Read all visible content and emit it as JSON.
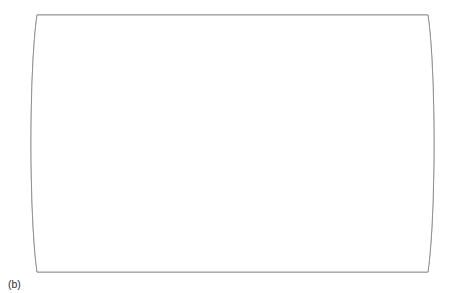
{
  "figure": {
    "caption": "(b)"
  },
  "graticule": {
    "labels": [
      {
        "id": "tropic-cancer",
        "text": "23½°N",
        "y": 112
      },
      {
        "id": "equator",
        "text": "0°",
        "y": 143
      },
      {
        "id": "tropic-capricorn",
        "text": "23½°S",
        "y": 175
      }
    ]
  },
  "legend": {
    "title": "Intermediate environments",
    "items": [
      {
        "label": "Savannah zones",
        "color": "#dcdcdc"
      },
      {
        "label": "Mediterranean zones",
        "color": "#9a9a9a"
      },
      {
        "label": "Mid-latitude grasslands",
        "color": "#6e6e6e"
      }
    ]
  },
  "colors": {
    "savannah": "#dcdcdc",
    "mediterranean": "#9a9a9a",
    "grassland": "#6e6e6e",
    "coastline": "#6e6e6e",
    "frame": "#7a7a7a",
    "text": "#2b2b2b",
    "background": "#ffffff"
  },
  "map": {
    "projection": "pseudo-cylindrical",
    "regions": [
      {
        "name": "North America Great Plains",
        "zone": "Mid-latitude grasslands"
      },
      {
        "name": "Central Mexico",
        "zone": "Savannah zones"
      },
      {
        "name": "California coast",
        "zone": "Mediterranean zones"
      },
      {
        "name": "Llanos and Cerrado",
        "zone": "Savannah zones"
      },
      {
        "name": "Pampas",
        "zone": "Mid-latitude grasslands"
      },
      {
        "name": "Chilean coast",
        "zone": "Mediterranean zones"
      },
      {
        "name": "Sahel and Sudan belt",
        "zone": "Savannah zones"
      },
      {
        "name": "East and Southern Africa",
        "zone": "Savannah zones"
      },
      {
        "name": "Cape region",
        "zone": "Mediterranean zones"
      },
      {
        "name": "Mediterranean basin",
        "zone": "Mediterranean zones"
      },
      {
        "name": "Eurasian steppe",
        "zone": "Mid-latitude grasslands"
      },
      {
        "name": "Scandinavia and Russia",
        "zone": "Mid-latitude grasslands"
      },
      {
        "name": "Mongolian steppe",
        "zone": "Mid-latitude grasslands"
      },
      {
        "name": "India Deccan",
        "zone": "Savannah zones"
      },
      {
        "name": "Northern Australia",
        "zone": "Savannah zones"
      },
      {
        "name": "Southwest and Southeast Australia",
        "zone": "Mediterranean zones"
      },
      {
        "name": "New Zealand",
        "zone": "Mediterranean zones"
      }
    ]
  }
}
